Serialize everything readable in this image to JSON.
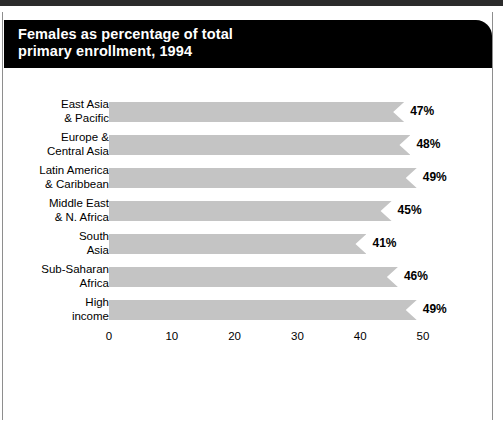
{
  "panel": {
    "title": "Females as percentage of total\nprimary enrollment, 1994",
    "background_color": "#ffffff",
    "title_band_color": "#000000",
    "title_text_color": "#ffffff",
    "border_color": "#8e8e8e"
  },
  "chart_data": {
    "type": "bar",
    "orientation": "horizontal",
    "title": "Females as percentage of total primary enrollment, 1994",
    "xlabel": "",
    "ylabel": "",
    "xlim": [
      0,
      50
    ],
    "grid": false,
    "legend": null,
    "bar_color": "#c4c4c4",
    "value_suffix": "%",
    "xticks": [
      0,
      10,
      20,
      30,
      40,
      50
    ],
    "xtick_labels": [
      "0",
      "10",
      "20",
      "30",
      "40",
      "50"
    ],
    "categories": [
      "East Asia\n& Pacific",
      "Europe &\nCentral Asia",
      "Latin America\n& Caribbean",
      "Middle East\n& N. Africa",
      "South\nAsia",
      "Sub-Saharan\nAfrica",
      "High\nincome"
    ],
    "values": [
      47,
      48,
      49,
      45,
      41,
      46,
      49
    ],
    "value_labels": [
      "47%",
      "48%",
      "49%",
      "45%",
      "41%",
      "46%",
      "49%"
    ]
  }
}
